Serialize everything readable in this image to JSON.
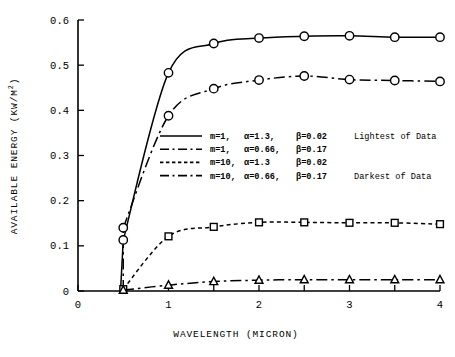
{
  "chart_data": {
    "type": "line",
    "title": "",
    "xlabel": "WAVELENGTH (MICRON)",
    "ylabel": "AVAILABLE ENERGY (KW/M2)",
    "ylabel_base": "AVAILABLE ENERGY  (KW/M",
    "ylabel_sup": "2",
    "ylabel_tail": ")",
    "xlim": [
      0,
      4
    ],
    "ylim": [
      0,
      0.6
    ],
    "grid": false,
    "legend_position": "center",
    "x_ticks": [
      0,
      0.5,
      1,
      1.5,
      2,
      2.5,
      3,
      3.5,
      4
    ],
    "x_tick_labels": [
      "0",
      "",
      "1",
      "",
      "2",
      "",
      "3",
      "",
      "4"
    ],
    "y_ticks": [
      0,
      0.1,
      0.2,
      0.3,
      0.4,
      0.5,
      0.6
    ],
    "y_tick_labels": [
      "0",
      "0.1",
      "0.2",
      "0.3",
      "0.4",
      "0.5",
      "0.6"
    ],
    "x": [
      0.5,
      1.0,
      1.5,
      2.0,
      2.5,
      3.0,
      3.5,
      4.0
    ],
    "series": [
      {
        "name": "m=1, a=1.3, b=0.02",
        "style": "solid",
        "marker": "circle",
        "values": [
          0.113,
          0.483,
          0.548,
          0.56,
          0.564,
          0.565,
          0.562,
          0.562
        ]
      },
      {
        "name": "m=1, a=0.66, b=0.17",
        "style": "dashdot",
        "marker": "circle",
        "values": [
          0.14,
          0.388,
          0.448,
          0.467,
          0.476,
          0.468,
          0.466,
          0.464
        ]
      },
      {
        "name": "m=10, a=1.3, b=0.02",
        "style": "dotted",
        "marker": "square",
        "values": [
          0.004,
          0.121,
          0.142,
          0.152,
          0.152,
          0.151,
          0.151,
          0.148
        ]
      },
      {
        "name": "m=10, a=0.66, b=0.17",
        "style": "dashdot",
        "marker": "triangle",
        "values": [
          0.002,
          0.013,
          0.021,
          0.024,
          0.025,
          0.025,
          0.025,
          0.025
        ]
      }
    ]
  },
  "legend": {
    "rows": [
      {
        "m": "m=1,",
        "alpha": "α=1.3,",
        "beta": "β=0.02",
        "note": "Lightest of Data",
        "style": "solid"
      },
      {
        "m": "m=1,",
        "alpha": "α=0.66,",
        "beta": "β=0.17",
        "note": "",
        "style": "dashdot"
      },
      {
        "m": "m=10,",
        "alpha": "α=1.3",
        "beta": "β=0.02",
        "note": "",
        "style": "dotted"
      },
      {
        "m": "m=10,",
        "alpha": "α=0.66,",
        "beta": "β=0.17",
        "note": "Darkest of Data",
        "style": "dashdot"
      }
    ]
  }
}
